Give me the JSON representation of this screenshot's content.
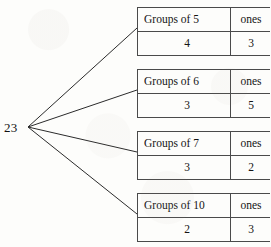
{
  "diagram": {
    "type": "number-decomposition-tree",
    "root": {
      "label": "23"
    },
    "branches": [
      {
        "group_header": "Groups of 5",
        "ones_header": "ones",
        "group_value": "4",
        "ones_value": "3"
      },
      {
        "group_header": "Groups of 6",
        "ones_header": "ones",
        "group_value": "3",
        "ones_value": "5"
      },
      {
        "group_header": "Groups of 7",
        "ones_header": "ones",
        "group_value": "3",
        "ones_value": "2"
      },
      {
        "group_header": "Groups of 10",
        "ones_header": "ones",
        "group_value": "2",
        "ones_value": "3"
      }
    ],
    "colors": {
      "background": "#fdfdfb",
      "ink": "#1a1a1a",
      "rule": "#4a4a4a"
    }
  }
}
